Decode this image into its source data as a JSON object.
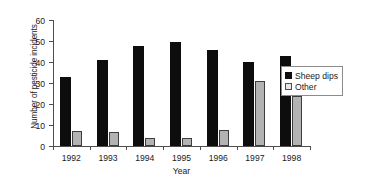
{
  "chart_data": {
    "type": "bar",
    "title": "",
    "subtitle": "",
    "xlabel": "Year",
    "ylabel": "Number of pesticide incidents",
    "categories": [
      "1992",
      "1993",
      "1994",
      "1995",
      "1996",
      "1997",
      "1998"
    ],
    "series": [
      {
        "name": "Sheep dips",
        "color": "#0d0d0d",
        "values": [
          33,
          41,
          47.5,
          49.5,
          45.5,
          40,
          43
        ]
      },
      {
        "name": "Other",
        "color": "#b3b3b3",
        "values": [
          7,
          6.5,
          4,
          4,
          7.5,
          31,
          24
        ]
      }
    ],
    "ylim": [
      0,
      60
    ],
    "yticks": [
      0,
      10,
      20,
      30,
      40,
      50,
      60
    ],
    "ytick_labels": [
      "0",
      "10",
      "20",
      "30",
      "40",
      "50",
      "60"
    ],
    "grid": false,
    "legend_position": "right-center",
    "legend_entries": [
      "Sheep dips",
      "Other"
    ]
  },
  "colors": {
    "background": "#ffffff",
    "axis": "#4d4d4d",
    "text": "#1a1a1a",
    "series_sheep_dips": "#0d0d0d",
    "series_other": "#b3b3b3",
    "series_other_border": "#3d3d3d",
    "legend_border": "#8c8c8c"
  }
}
